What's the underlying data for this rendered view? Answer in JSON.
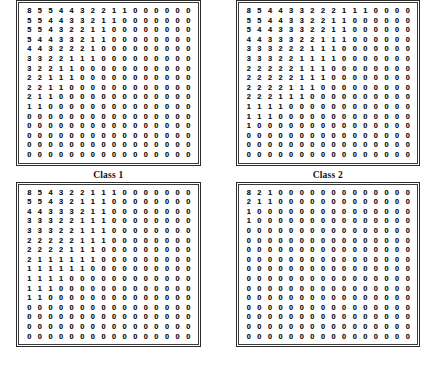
{
  "figure": {
    "panels": [
      {
        "id": "panel-class-1",
        "caption": "Class 1",
        "rows": [
          [
            8,
            5,
            5,
            4,
            4,
            3,
            2,
            2,
            1,
            1,
            0,
            0,
            0,
            0,
            0,
            0
          ],
          [
            5,
            5,
            4,
            4,
            3,
            3,
            2,
            1,
            1,
            0,
            0,
            0,
            0,
            0,
            0,
            0
          ],
          [
            5,
            5,
            4,
            3,
            2,
            2,
            1,
            1,
            0,
            0,
            0,
            0,
            0,
            0,
            0,
            0
          ],
          [
            5,
            4,
            4,
            3,
            3,
            2,
            1,
            1,
            0,
            0,
            0,
            0,
            0,
            0,
            0,
            0
          ],
          [
            4,
            4,
            3,
            2,
            2,
            2,
            1,
            0,
            0,
            0,
            0,
            0,
            0,
            0,
            0,
            0
          ],
          [
            3,
            3,
            2,
            2,
            1,
            1,
            1,
            0,
            0,
            0,
            0,
            0,
            0,
            0,
            0,
            0
          ],
          [
            3,
            2,
            2,
            1,
            1,
            0,
            0,
            0,
            0,
            0,
            0,
            0,
            0,
            0,
            0,
            0
          ],
          [
            2,
            2,
            1,
            1,
            1,
            0,
            0,
            0,
            0,
            0,
            0,
            0,
            0,
            0,
            0,
            0
          ],
          [
            2,
            2,
            1,
            1,
            0,
            0,
            0,
            0,
            0,
            0,
            0,
            0,
            0,
            0,
            0,
            0
          ],
          [
            2,
            1,
            1,
            0,
            0,
            0,
            0,
            0,
            0,
            0,
            0,
            0,
            0,
            0,
            0,
            0
          ],
          [
            1,
            1,
            0,
            0,
            0,
            0,
            0,
            0,
            0,
            0,
            0,
            0,
            0,
            0,
            0,
            0
          ],
          [
            0,
            0,
            0,
            0,
            0,
            0,
            0,
            0,
            0,
            0,
            0,
            0,
            0,
            0,
            0,
            0
          ],
          [
            0,
            0,
            0,
            0,
            0,
            0,
            0,
            0,
            0,
            0,
            0,
            0,
            0,
            0,
            0,
            0
          ],
          [
            0,
            0,
            0,
            0,
            0,
            0,
            0,
            0,
            0,
            0,
            0,
            0,
            0,
            0,
            0,
            0
          ],
          [
            0,
            0,
            0,
            0,
            0,
            0,
            0,
            0,
            0,
            0,
            0,
            0,
            0,
            0,
            0,
            0
          ],
          [
            0,
            0,
            0,
            0,
            0,
            0,
            0,
            0,
            0,
            0,
            0,
            0,
            0,
            0,
            0,
            0
          ]
        ]
      },
      {
        "id": "panel-class-2",
        "caption": "Class 2",
        "rows": [
          [
            8,
            5,
            4,
            4,
            3,
            3,
            2,
            2,
            2,
            1,
            1,
            1,
            0,
            0,
            0,
            0
          ],
          [
            5,
            5,
            4,
            4,
            3,
            3,
            2,
            2,
            1,
            1,
            0,
            0,
            0,
            0,
            0,
            0
          ],
          [
            5,
            4,
            4,
            3,
            3,
            3,
            2,
            2,
            1,
            1,
            0,
            0,
            0,
            0,
            0,
            0
          ],
          [
            4,
            4,
            3,
            3,
            3,
            2,
            2,
            1,
            1,
            1,
            0,
            0,
            0,
            0,
            0,
            0
          ],
          [
            3,
            3,
            3,
            2,
            2,
            2,
            1,
            1,
            1,
            0,
            0,
            0,
            0,
            0,
            0,
            0
          ],
          [
            3,
            3,
            3,
            2,
            2,
            1,
            1,
            1,
            1,
            0,
            0,
            0,
            0,
            0,
            0,
            0
          ],
          [
            2,
            2,
            2,
            2,
            2,
            1,
            1,
            1,
            0,
            0,
            0,
            0,
            0,
            0,
            0,
            0
          ],
          [
            2,
            2,
            2,
            2,
            2,
            1,
            1,
            1,
            0,
            0,
            0,
            0,
            0,
            0,
            0,
            0
          ],
          [
            2,
            2,
            2,
            2,
            1,
            1,
            1,
            0,
            0,
            0,
            0,
            0,
            0,
            0,
            0,
            0
          ],
          [
            2,
            2,
            2,
            1,
            1,
            1,
            0,
            0,
            0,
            0,
            0,
            0,
            0,
            0,
            0,
            0
          ],
          [
            1,
            1,
            1,
            1,
            0,
            0,
            0,
            0,
            0,
            0,
            0,
            0,
            0,
            0,
            0,
            0
          ],
          [
            1,
            1,
            1,
            0,
            0,
            0,
            0,
            0,
            0,
            0,
            0,
            0,
            0,
            0,
            0,
            0
          ],
          [
            1,
            0,
            0,
            0,
            0,
            0,
            0,
            0,
            0,
            0,
            0,
            0,
            0,
            0,
            0,
            0
          ],
          [
            0,
            0,
            0,
            0,
            0,
            0,
            0,
            0,
            0,
            0,
            0,
            0,
            0,
            0,
            0,
            0
          ],
          [
            0,
            0,
            0,
            0,
            0,
            0,
            0,
            0,
            0,
            0,
            0,
            0,
            0,
            0,
            0,
            0
          ],
          [
            0,
            0,
            0,
            0,
            0,
            0,
            0,
            0,
            0,
            0,
            0,
            0,
            0,
            0,
            0,
            0
          ]
        ]
      },
      {
        "id": "panel-class-3",
        "caption": "",
        "rows": [
          [
            8,
            5,
            4,
            3,
            2,
            2,
            1,
            1,
            1,
            0,
            0,
            0,
            0,
            0,
            0,
            0
          ],
          [
            5,
            5,
            4,
            3,
            2,
            1,
            1,
            1,
            0,
            0,
            0,
            0,
            0,
            0,
            0,
            0
          ],
          [
            4,
            4,
            3,
            3,
            3,
            2,
            1,
            1,
            0,
            0,
            0,
            0,
            0,
            0,
            0,
            0
          ],
          [
            3,
            3,
            3,
            2,
            2,
            1,
            1,
            1,
            0,
            0,
            0,
            0,
            0,
            0,
            0,
            0
          ],
          [
            3,
            3,
            3,
            2,
            2,
            1,
            1,
            1,
            0,
            0,
            0,
            0,
            0,
            0,
            0,
            0
          ],
          [
            2,
            2,
            2,
            2,
            2,
            1,
            1,
            1,
            0,
            0,
            0,
            0,
            0,
            0,
            0,
            0
          ],
          [
            2,
            2,
            2,
            2,
            1,
            1,
            1,
            0,
            0,
            0,
            0,
            0,
            0,
            0,
            0,
            0
          ],
          [
            2,
            1,
            1,
            1,
            1,
            1,
            1,
            0,
            0,
            0,
            0,
            0,
            0,
            0,
            0,
            0
          ],
          [
            1,
            1,
            1,
            1,
            1,
            1,
            0,
            0,
            0,
            0,
            0,
            0,
            0,
            0,
            0,
            0
          ],
          [
            1,
            1,
            1,
            1,
            0,
            0,
            0,
            0,
            0,
            0,
            0,
            0,
            0,
            0,
            0,
            0
          ],
          [
            1,
            1,
            1,
            0,
            0,
            0,
            0,
            0,
            0,
            0,
            0,
            0,
            0,
            0,
            0,
            0
          ],
          [
            1,
            1,
            0,
            0,
            0,
            0,
            0,
            0,
            0,
            0,
            0,
            0,
            0,
            0,
            0,
            0
          ],
          [
            0,
            0,
            0,
            0,
            0,
            0,
            0,
            0,
            0,
            0,
            0,
            0,
            0,
            0,
            0,
            0
          ],
          [
            0,
            0,
            0,
            0,
            0,
            0,
            0,
            0,
            0,
            0,
            0,
            0,
            0,
            0,
            0,
            0
          ],
          [
            0,
            0,
            0,
            0,
            0,
            0,
            0,
            0,
            0,
            0,
            0,
            0,
            0,
            0,
            0,
            0
          ],
          [
            0,
            0,
            0,
            0,
            0,
            0,
            0,
            0,
            0,
            0,
            0,
            0,
            0,
            0,
            0,
            0
          ]
        ]
      },
      {
        "id": "panel-class-4",
        "caption": "",
        "rows": [
          [
            8,
            2,
            1,
            0,
            0,
            0,
            0,
            0,
            0,
            0,
            0,
            0,
            0,
            0,
            0,
            0
          ],
          [
            2,
            1,
            1,
            0,
            0,
            0,
            0,
            0,
            0,
            0,
            0,
            0,
            0,
            0,
            0,
            0
          ],
          [
            1,
            0,
            0,
            0,
            0,
            0,
            0,
            0,
            0,
            0,
            0,
            0,
            0,
            0,
            0,
            0
          ],
          [
            1,
            0,
            0,
            0,
            0,
            0,
            0,
            0,
            0,
            0,
            0,
            0,
            0,
            0,
            0,
            0
          ],
          [
            0,
            0,
            0,
            0,
            0,
            0,
            0,
            0,
            0,
            0,
            0,
            0,
            0,
            0,
            0,
            0
          ],
          [
            0,
            0,
            0,
            0,
            0,
            0,
            0,
            0,
            0,
            0,
            0,
            0,
            0,
            0,
            0,
            0
          ],
          [
            0,
            0,
            0,
            0,
            0,
            0,
            0,
            0,
            0,
            0,
            0,
            0,
            0,
            0,
            0,
            0
          ],
          [
            0,
            0,
            0,
            0,
            0,
            0,
            0,
            0,
            0,
            0,
            0,
            0,
            0,
            0,
            0,
            0
          ],
          [
            0,
            0,
            0,
            0,
            0,
            0,
            0,
            0,
            0,
            0,
            0,
            0,
            0,
            0,
            0,
            0
          ],
          [
            0,
            0,
            0,
            0,
            0,
            0,
            0,
            0,
            0,
            0,
            0,
            0,
            0,
            0,
            0,
            0
          ],
          [
            0,
            0,
            0,
            0,
            0,
            0,
            0,
            0,
            0,
            0,
            0,
            0,
            0,
            0,
            0,
            0
          ],
          [
            0,
            0,
            0,
            0,
            0,
            0,
            0,
            0,
            0,
            0,
            0,
            0,
            0,
            0,
            0,
            0
          ],
          [
            0,
            0,
            0,
            0,
            0,
            0,
            0,
            0,
            0,
            0,
            0,
            0,
            0,
            0,
            0,
            0
          ],
          [
            0,
            0,
            0,
            0,
            0,
            0,
            0,
            0,
            0,
            0,
            0,
            0,
            0,
            0,
            0,
            0
          ],
          [
            0,
            0,
            0,
            0,
            0,
            0,
            0,
            0,
            0,
            0,
            0,
            0,
            0,
            0,
            0,
            0
          ],
          [
            0,
            0,
            0,
            0,
            0,
            0,
            0,
            0,
            0,
            0,
            0,
            0,
            0,
            0,
            0,
            0
          ]
        ]
      }
    ]
  },
  "colors": {
    "page_background": "#ffffff",
    "border": "#2b2b2b",
    "text": "#141414"
  }
}
